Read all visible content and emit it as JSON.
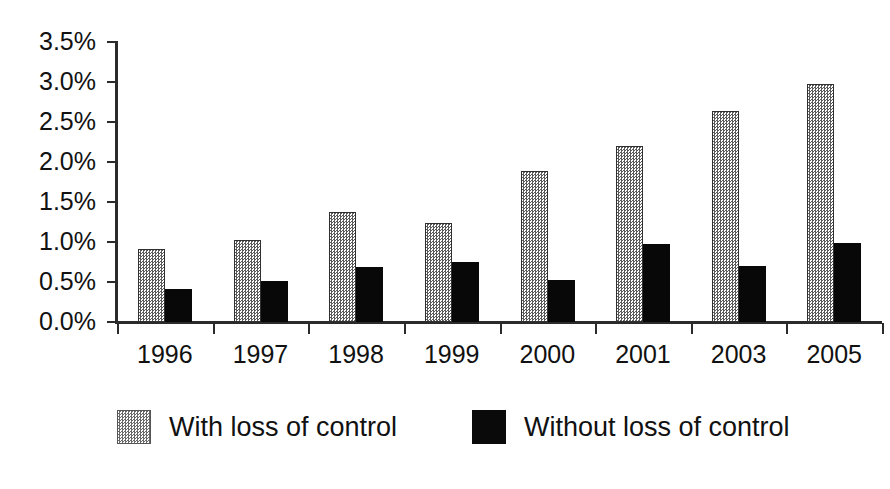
{
  "chart_data": {
    "type": "bar",
    "title": "",
    "subtitle": "",
    "xlabel": "",
    "ylabel": "",
    "categories": [
      "1996",
      "1997",
      "1998",
      "1999",
      "2000",
      "2001",
      "2003",
      "2005"
    ],
    "series": [
      {
        "name": "With loss of control",
        "color": "#cccccc",
        "pattern": "stipple",
        "values": [
          0.91,
          1.02,
          1.37,
          1.24,
          1.89,
          2.2,
          2.64,
          2.97
        ]
      },
      {
        "name": "Without loss of control",
        "color": "#000000",
        "pattern": "solid",
        "values": [
          0.41,
          0.51,
          0.69,
          0.75,
          0.52,
          0.97,
          0.7,
          0.99
        ]
      }
    ],
    "ylim": [
      0.0,
      3.5
    ],
    "ytick_values": [
      0.0,
      0.5,
      1.0,
      1.5,
      2.0,
      2.5,
      3.0,
      3.5
    ],
    "ytick_labels": [
      "0.0%",
      "0.5%",
      "1.0%",
      "1.5%",
      "2.0%",
      "2.5%",
      "3.0%",
      "3.5%"
    ],
    "value_format": "percent",
    "grid": false,
    "legend_position": "bottom",
    "legend_entries": [
      "With loss of control",
      "Without loss of control"
    ]
  }
}
